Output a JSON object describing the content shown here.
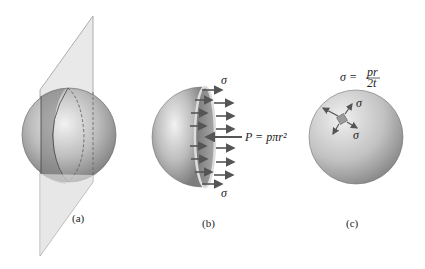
{
  "figure": {
    "panels": [
      {
        "id": "a",
        "label": "(a)",
        "description": "Sphere cut by a vertical plane"
      },
      {
        "id": "b",
        "label": "(b)",
        "description": "Hemisphere free body with normal stress arrows and internal pressure resultant",
        "stress_top": "σ",
        "stress_bottom": "σ",
        "force_label": "P = pπr²"
      },
      {
        "id": "c",
        "label": "(c)",
        "description": "Sphere with biaxial stress element",
        "formula_lhs": "σ =",
        "formula_num": "pr",
        "formula_den": "2t",
        "stress_label_1": "σ",
        "stress_label_2": "σ"
      }
    ]
  },
  "colors": {
    "sphere_light": "#e8e8e8",
    "sphere_dark": "#8a8a8a",
    "plane": "#d9d9d9",
    "arrow": "#555555",
    "text": "#222222"
  }
}
